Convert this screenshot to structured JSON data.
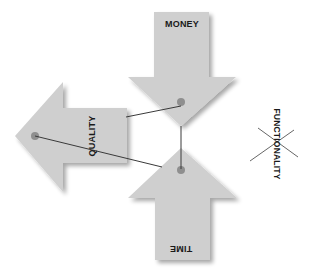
{
  "diagram": {
    "title": "",
    "colors": {
      "arrow_fill": "#cfcfcf",
      "arrow_shadow": "#b5b5b5",
      "connector": "#3a3a3a",
      "dot": "#8f8f8f",
      "cross": "#555555",
      "label": "#1a1a1a"
    },
    "arrows": [
      {
        "id": "money",
        "label": "MONEY",
        "direction": "down"
      },
      {
        "id": "quality",
        "label": "QUALITY",
        "direction": "left"
      },
      {
        "id": "time",
        "label": "TIME",
        "direction": "up"
      }
    ],
    "crossed_out": {
      "label": "FUNCTIONALITY",
      "marker": "x-cross"
    },
    "connections": [
      {
        "from": "quality",
        "to": "money"
      },
      {
        "from": "money",
        "to": "time"
      },
      {
        "from": "quality",
        "to": "time"
      }
    ]
  }
}
